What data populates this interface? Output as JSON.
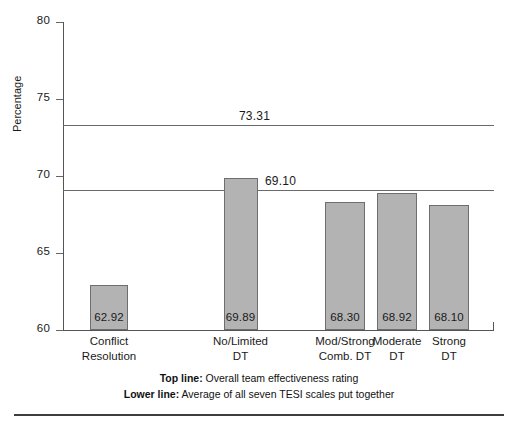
{
  "chart_data": {
    "type": "bar",
    "title": "",
    "xlabel": "",
    "ylabel": "Percentage",
    "ylim": [
      60,
      80
    ],
    "yticks": [
      "60",
      "65",
      "70",
      "75",
      "80"
    ],
    "grid": false,
    "legend_position": "below-axis",
    "categories": [
      "Conflict\nResolution",
      "No/Limited\nDT",
      "Mod/Strong\nComb. DT",
      "Moderate\nDT",
      "Strong\nDT"
    ],
    "category_lines": [
      [
        "Conflict",
        "Resolution"
      ],
      [
        "No/Limited",
        "DT"
      ],
      [
        "Mod/Strong",
        "Comb. DT"
      ],
      [
        "Moderate",
        "DT"
      ],
      [
        "Strong",
        "DT"
      ]
    ],
    "values": [
      62.92,
      69.89,
      68.3,
      68.92,
      68.1
    ],
    "value_labels": [
      "62.92",
      "69.89",
      "68.30",
      "68.92",
      "68.10"
    ],
    "reference_lines": [
      {
        "name": "top-line",
        "value": 73.31,
        "label": "73.31"
      },
      {
        "name": "lower-line",
        "value": 69.1,
        "label": "69.10"
      }
    ],
    "bar_color": "#b3b3b3",
    "bar_border_color": "#6e6e6e",
    "line_color": "#6a6a6a"
  },
  "footnotes": [
    {
      "bold": "Top line:",
      "text": " Overall team effectiveness rating"
    },
    {
      "bold": "Lower line:",
      "text": " Average of all seven TESI scales put together"
    }
  ]
}
